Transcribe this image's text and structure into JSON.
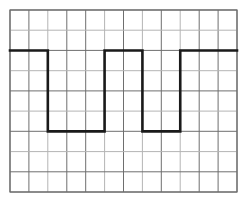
{
  "chart_data": {
    "type": "line",
    "title": "",
    "subtitle": "",
    "xlabel": "",
    "ylabel": "",
    "annotations": [],
    "legend": [],
    "legend_position": "none",
    "grid": true,
    "grid_columns": 12,
    "grid_rows": 9,
    "xlim": [
      0,
      12
    ],
    "ylim": [
      0,
      9
    ],
    "axis_tick_labels_x": [],
    "axis_tick_labels_y": [],
    "waveform_name": "square-wave",
    "high_level": 7,
    "low_level": 3,
    "series": [
      {
        "name": "square-wave",
        "x": [
          0,
          2,
          2,
          5,
          5,
          7,
          7,
          9,
          9,
          12
        ],
        "y": [
          7,
          7,
          3,
          3,
          7,
          7,
          3,
          3,
          7,
          7
        ]
      }
    ]
  },
  "style": {
    "trace_color": "#1a1a1a",
    "grid_major_color": "#6e6e6e",
    "grid_minor_color": "#b4b4b4",
    "border_color": "#6e6e6e",
    "background_color": "#ffffff",
    "trace_width": "2.6",
    "grid_major_width": "1",
    "grid_minor_width": "1"
  },
  "geometry": {
    "plot_left": 10,
    "plot_top": 10,
    "plot_right": 237,
    "plot_bottom": 192,
    "cell_width": 18.9,
    "cell_height": 20.2
  }
}
